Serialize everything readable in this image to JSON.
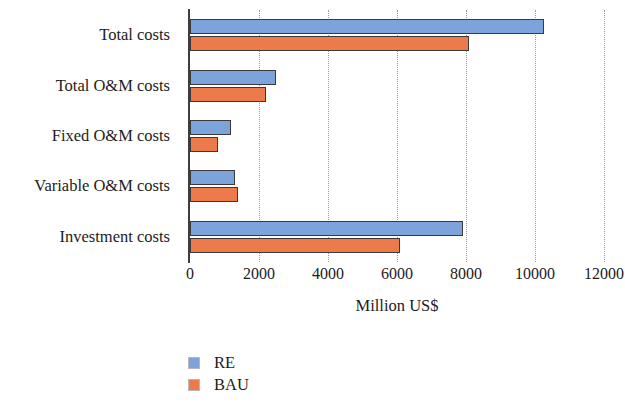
{
  "chart_data": {
    "type": "bar",
    "orientation": "horizontal",
    "title": "",
    "subtitle": "",
    "xlabel": "Million US$",
    "ylabel": "",
    "xlim": [
      0,
      12000
    ],
    "xticks": [
      0,
      2000,
      4000,
      6000,
      8000,
      10000,
      12000
    ],
    "xtick_labels": [
      "0",
      "2000",
      "4000",
      "6000",
      "8000",
      "10000",
      "12000"
    ],
    "grid": "vertical-dotted",
    "legend_position": "bottom-left",
    "categories": [
      "Total costs",
      "Total O&M costs",
      "Fixed O&M costs",
      "Variable O&M costs",
      "Investment costs"
    ],
    "series": [
      {
        "name": "RE",
        "color": "#7ca3da",
        "values": [
          10250,
          2500,
          1200,
          1300,
          7900
        ]
      },
      {
        "name": "BAU",
        "color": "#ec7a4a",
        "values": [
          8100,
          2200,
          800,
          1400,
          6100
        ]
      }
    ],
    "annotations": []
  },
  "legend": {
    "items": [
      {
        "label": "RE",
        "color": "#7ca3da"
      },
      {
        "label": "BAU",
        "color": "#ec7a4a"
      }
    ]
  },
  "axis": {
    "x_title": "Million US$"
  }
}
